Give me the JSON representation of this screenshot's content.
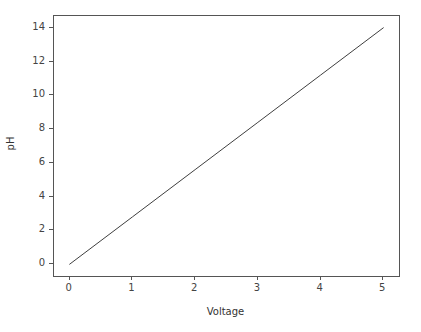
{
  "chart_data": {
    "type": "line",
    "title": "",
    "xlabel": "Voltage",
    "ylabel": "pH",
    "xlim": [
      -0.25,
      5.25
    ],
    "ylim": [
      -0.7,
      14.7
    ],
    "xticks": [
      0,
      1,
      2,
      3,
      4,
      5
    ],
    "yticks": [
      0,
      2,
      4,
      6,
      8,
      10,
      12,
      14
    ],
    "xtick_labels": [
      "0",
      "1",
      "2",
      "3",
      "4",
      "5"
    ],
    "ytick_labels": [
      "0",
      "2",
      "4",
      "6",
      "8",
      "10",
      "12",
      "14"
    ],
    "grid": false,
    "legend": null,
    "legend_position": "none",
    "series": [
      {
        "name": "pH vs Voltage",
        "color": "#3f3f3f",
        "linewidth": 1,
        "x": [
          0,
          1,
          2,
          3,
          4,
          5
        ],
        "values": [
          0,
          2.8,
          5.6,
          8.4,
          11.2,
          14
        ]
      }
    ],
    "annotations": []
  },
  "figure": {
    "background": "#ffffff",
    "spine_color": "#555555",
    "tick_color": "#555555",
    "text_color": "#444444"
  }
}
